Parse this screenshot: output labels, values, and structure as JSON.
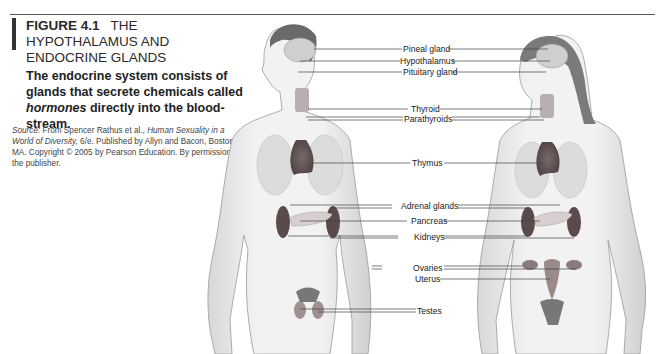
{
  "figure": {
    "number": "FIGURE 4.1",
    "title": "THE HYPOTHALAMUS AND ENDOCRINE GLANDS",
    "description_parts": {
      "before": "The endocrine system consists of glands that secrete chemicals called ",
      "emphasis": "hormones",
      "after": " directly into the blood-stream."
    },
    "source": {
      "prefix": "Source:",
      "text1": " From Spencer Rathus et al., ",
      "book": "Human Sexuality in a World of Diversity,",
      "text2": " 6/e. Published by Allyn and Bacon, Boston, MA. Copyright © 2005 by Pearson Education. By permission of the publisher."
    }
  },
  "labels": {
    "pineal": "Pineal gland",
    "hypothalamus": "Hypothalamus",
    "pituitary": "Pituitary gland",
    "thyroid": "Thyroid",
    "parathyroids": "Parathyroids",
    "thymus": "Thymus",
    "adrenal": "Adrenal glands",
    "pancreas": "Pancreas",
    "kidneys": "Kidneys",
    "ovaries": "Ovaries",
    "uterus": "Uterus",
    "testes": "Testes"
  },
  "figures_depicted": [
    "male-body",
    "female-body"
  ]
}
